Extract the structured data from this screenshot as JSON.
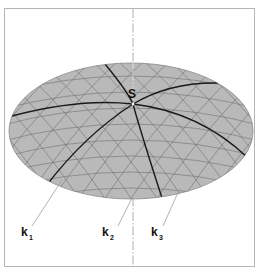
{
  "diagram": {
    "title": "",
    "apex_label": "S",
    "curve_labels": [
      {
        "base": "k",
        "sub": "1"
      },
      {
        "base": "k",
        "sub": "2"
      },
      {
        "base": "k",
        "sub": "3"
      }
    ],
    "colors": {
      "surface": "#b9b9b9",
      "surface_edge": "#8a8a8a",
      "grid": "#6a6a6a",
      "bold_curve": "#1a1a1a",
      "axis": "#9a9a9a",
      "frame": "#b5b5b5",
      "leader": "#a0a0a0",
      "text": "#111111"
    }
  }
}
